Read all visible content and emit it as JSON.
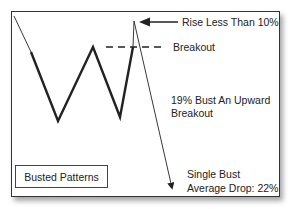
{
  "diagram": {
    "annotations": {
      "rise": "Rise Less Than 10%",
      "breakout": "Breakout",
      "bust_line1": "19% Bust An Upward",
      "bust_line2": "Breakout",
      "single_line1": "Single Bust",
      "single_line2": "Average Drop: 22%"
    },
    "legend": "Busted Patterns",
    "colors": {
      "line": "#222222",
      "frame": "#333333",
      "text": "#222222"
    }
  }
}
